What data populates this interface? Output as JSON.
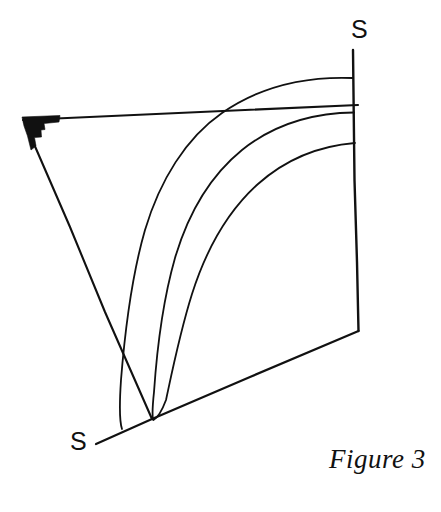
{
  "figure": {
    "caption": "Figure 3",
    "background_color": "#ffffff",
    "ink_color": "#111111",
    "width": 441,
    "height": 512,
    "labels": {
      "axis_top": "S",
      "axis_bottom": "S"
    },
    "annotations": {
      "right_angle_marker": "filled-wedge-at-apex"
    },
    "geometry": {
      "apex": [
        22,
        119
      ],
      "top_edge_end": [
        358,
        105
      ],
      "vertical_axis_top": [
        353,
        50
      ],
      "vertical_axis_bottom": [
        358,
        331
      ],
      "bottom_axis_end": [
        96,
        444
      ],
      "left_edge_end": [
        152,
        420
      ],
      "arc_endpoints_on_vertical_y": [
        78,
        113,
        143
      ],
      "arc_endpoints_on_bottom_x": [
        122,
        152,
        155
      ],
      "crossing_line_arc_upper": [
        222,
        113
      ],
      "crossing_line_arc_left": [
        105,
        312
      ]
    }
  }
}
